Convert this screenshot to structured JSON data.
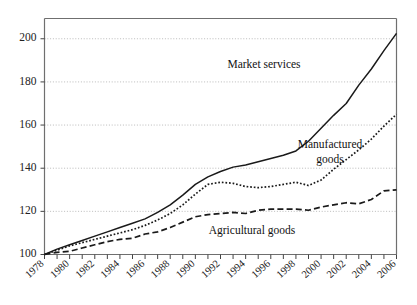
{
  "chart_data": {
    "type": "line",
    "title": "",
    "subtitle": "",
    "xlabel": "",
    "ylabel": "",
    "xlim": [
      1978,
      2006
    ],
    "ylim": [
      96,
      208
    ],
    "grid": true,
    "grid_axis": "y",
    "legend_position": "inline-annotations",
    "base_year": 1978,
    "base_value": 100,
    "ytick_values": [
      100,
      120,
      140,
      160,
      180,
      200
    ],
    "ytick_labels": [
      "100",
      "120",
      "140",
      "160",
      "180",
      "200"
    ],
    "xtick_labels": [
      "1978",
      "1980",
      "1982",
      "1984",
      "1986",
      "1988",
      "1990",
      "1992",
      "1994",
      "1996",
      "1998",
      "2000",
      "2002",
      "2004",
      "2006"
    ],
    "xtick_values": [
      1978,
      1980,
      1982,
      1984,
      1986,
      1988,
      1990,
      1992,
      1994,
      1996,
      1998,
      2000,
      2002,
      2004,
      2006
    ],
    "minor_tick_interval": 1,
    "x": [
      1978,
      1979,
      1980,
      1981,
      1982,
      1983,
      1984,
      1985,
      1986,
      1987,
      1988,
      1989,
      1990,
      1991,
      1992,
      1993,
      1994,
      1995,
      1996,
      1997,
      1998,
      1999,
      2000,
      2001,
      2002,
      2003,
      2004,
      2005,
      2006
    ],
    "series": [
      {
        "name": "Market services",
        "style": "solid",
        "color": "#1a1a1a",
        "values": [
          100,
          102.5,
          104.5,
          106.5,
          108.5,
          110.5,
          112.5,
          114.5,
          116.5,
          119.5,
          123.0,
          127.5,
          132.5,
          136.0,
          138.5,
          140.5,
          141.5,
          143.0,
          144.5,
          146.0,
          148.0,
          152.5,
          158.5,
          164.5,
          170.0,
          178.5,
          186.0,
          194.5,
          202.5
        ]
      },
      {
        "name": "Manufactured goods",
        "style": "dotted",
        "color": "#1a1a1a",
        "values": [
          100,
          102.0,
          104.0,
          105.5,
          107.0,
          108.5,
          110.0,
          111.5,
          113.5,
          116.0,
          119.0,
          123.0,
          128.0,
          132.5,
          133.5,
          133.0,
          131.5,
          131.0,
          131.5,
          132.5,
          133.5,
          132.0,
          134.5,
          139.5,
          144.0,
          148.5,
          153.5,
          159.5,
          165.0
        ]
      },
      {
        "name": "Agricultural goods",
        "style": "dashed",
        "color": "#1a1a1a",
        "values": [
          100,
          101.0,
          101.5,
          103.0,
          104.5,
          106.0,
          107.0,
          107.5,
          109.5,
          110.5,
          112.5,
          115.0,
          117.5,
          118.5,
          119.0,
          119.5,
          119.0,
          120.5,
          121.0,
          121.0,
          121.0,
          120.5,
          122.0,
          123.0,
          124.0,
          123.5,
          125.5,
          129.5,
          130.0
        ]
      }
    ],
    "annotations": [
      {
        "text": "Market services",
        "series": "Market services",
        "x_px": 264,
        "y_px": 68
      },
      {
        "text": "Manufactured",
        "series": "Manufactured goods",
        "x_px": 330,
        "y_px": 148
      },
      {
        "text": "goods",
        "series": "Manufactured goods",
        "x_px": 330,
        "y_px": 163
      },
      {
        "text": "Agricultural goods",
        "series": "Agricultural goods",
        "x_px": 252,
        "y_px": 234
      }
    ]
  },
  "axes": {
    "frame_color": "#6f6f6f",
    "gridline_color": "#aaaaaa",
    "tick_color": "#444444"
  }
}
